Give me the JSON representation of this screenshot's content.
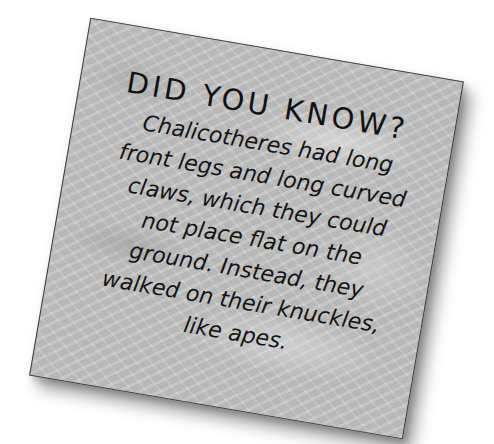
{
  "card": {
    "title": "DID YOU KNOW?",
    "body_lines": [
      "Chalicotheres had long",
      "front legs and long curved",
      "claws, which they could",
      "not place flat on the",
      "ground. Instead, they",
      "walked on their knuckles,",
      "like apes."
    ],
    "body_full": "Chalicotheres had long front legs and long curved claws, which they could not place flat on the ground. Instead, they walked on their knuckles, like apes.",
    "background": "grey fern-texture",
    "colors": {
      "card_background": "#c4c4c4",
      "text": "#141414",
      "border": "#3a3a3a",
      "page_background": "#ffffff"
    }
  }
}
